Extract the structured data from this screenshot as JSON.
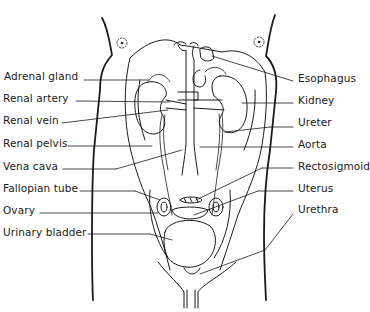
{
  "figure": {
    "left_labels": [
      {
        "text": "Adrenal gland",
        "x": 4,
        "y": 76
      },
      {
        "text": "Renal artery",
        "x": 3,
        "y": 98
      },
      {
        "text": "Renal vein",
        "x": 3,
        "y": 120
      },
      {
        "text": "Renal pelvis",
        "x": 3,
        "y": 143
      },
      {
        "text": "Vena cava",
        "x": 3,
        "y": 166
      },
      {
        "text": "Fallopian tube",
        "x": 3,
        "y": 188
      },
      {
        "text": "Ovary",
        "x": 3,
        "y": 209
      },
      {
        "text": "Urinary bladder",
        "x": 3,
        "y": 231
      }
    ],
    "right_labels": [
      {
        "text": "Esophagus",
        "x": 298,
        "y": 78
      },
      {
        "text": "Kidney",
        "x": 298,
        "y": 99
      },
      {
        "text": "Ureter",
        "x": 298,
        "y": 121
      },
      {
        "text": "Aorta",
        "x": 298,
        "y": 143
      },
      {
        "text": "Rectosigmoid",
        "x": 298,
        "y": 165
      },
      {
        "text": "Uterus",
        "x": 298,
        "y": 187
      },
      {
        "text": "Urethra",
        "x": 298,
        "y": 208
      }
    ],
    "line_color": "#1a1a1a",
    "background": "#ffffff"
  }
}
